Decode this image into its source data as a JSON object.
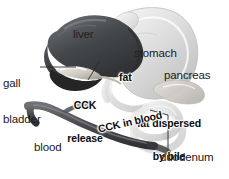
{
  "figure": {
    "background_color": "#ffffff",
    "width": 229,
    "height": 179
  },
  "palette": {
    "liver_dark": "#3d3f42",
    "liver_mid": "#5a5d61",
    "gallbladder_light": "#d8d4cc",
    "stomach_light": "#d9d9d9",
    "duodenum_light": "#cfcfcf",
    "vessel_dark": "#4a4c4f",
    "label_text": "#202020",
    "bold_label_text": "#0b0b0b",
    "leader_line": "#2b2b2b"
  },
  "labels": [
    {
      "id": "gall-bladder",
      "text": "gall\nbladder",
      "style": "plain",
      "align": "left",
      "x": 3,
      "y": 60,
      "lines": [
        "gall",
        "bladder"
      ]
    },
    {
      "id": "liver",
      "text": "liver",
      "style": "plain",
      "align": "left",
      "x": 73,
      "y": 33,
      "lines": [
        "liver"
      ]
    },
    {
      "id": "stomach",
      "text": "stomach",
      "style": "plain",
      "align": "left",
      "x": 134,
      "y": 52,
      "lines": [
        "stomach"
      ]
    },
    {
      "id": "pancreas",
      "text": "pancreas",
      "style": "plain",
      "align": "left",
      "x": 164,
      "y": 74,
      "lines": [
        "pancreas"
      ]
    },
    {
      "id": "cck-release",
      "text": "CCK\nrelease",
      "style": "bold",
      "align": "center",
      "x": 68,
      "y": 83,
      "lines": [
        "CCK",
        "release"
      ]
    },
    {
      "id": "fat",
      "text": "fat",
      "style": "bold",
      "align": "left",
      "x": 119,
      "y": 76,
      "lines": [
        "fat"
      ]
    },
    {
      "id": "fat-dispersed-by-bile",
      "text": "fat dispersed\nby bile",
      "style": "bold",
      "align": "center",
      "x": 133,
      "y": 100,
      "lines": [
        "fat dispersed",
        "by bile"
      ]
    },
    {
      "id": "cck-in-blood",
      "text": "CCK in blood",
      "style": "bold",
      "align": "left",
      "x": 97,
      "y": 124,
      "rotation": -13,
      "lines": [
        "CCK in blood"
      ]
    },
    {
      "id": "blood-vessel",
      "text": "blood\nvessel",
      "style": "plain",
      "align": "left",
      "x": 34,
      "y": 123,
      "lines": [
        "blood",
        "vessel"
      ]
    },
    {
      "id": "duodenum",
      "text": "duodenum",
      "style": "plain",
      "align": "left",
      "x": 160,
      "y": 156,
      "lines": [
        "duodenum"
      ]
    }
  ],
  "leader_lines": [
    {
      "id": "gall-bladder-leader",
      "from": [
        40,
        67
      ],
      "to": [
        76,
        67
      ]
    },
    {
      "id": "cck-release-leader",
      "from": [
        88,
        80
      ],
      "to": [
        99,
        62
      ]
    },
    {
      "id": "duodenum-leader",
      "from": [
        168,
        153
      ],
      "to": [
        168,
        115
      ]
    }
  ],
  "organs": [
    {
      "id": "liver",
      "label": "liver"
    },
    {
      "id": "gall-bladder",
      "label": "gall bladder"
    },
    {
      "id": "stomach",
      "label": "stomach"
    },
    {
      "id": "pancreas",
      "label": "pancreas"
    },
    {
      "id": "duodenum",
      "label": "duodenum"
    },
    {
      "id": "blood-vessel",
      "label": "blood vessel"
    }
  ]
}
